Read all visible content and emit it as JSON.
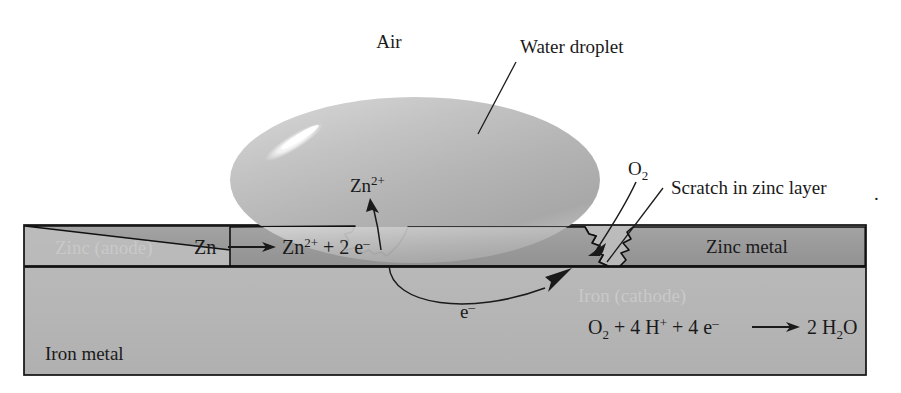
{
  "figure": {
    "colors": {
      "zinc_layer": "#9b9b9b",
      "iron_body": "#b6b6b6",
      "droplet": "#b9b9b9",
      "droplet_highlight": "#ffffff",
      "outline": "#111111",
      "text": "#1a1a1a",
      "ghost_text": "#c9c9c9",
      "background": "#ffffff"
    }
  },
  "labels": {
    "air": "Air",
    "water_droplet": "Water droplet",
    "scratch": "Scratch in zinc layer",
    "zinc_metal": "Zinc metal",
    "iron_metal": "Iron metal",
    "zinc_anode": "Zinc (anode)",
    "iron_cathode": "Iron (cathode)",
    "oxygen": "O",
    "oxygen_sub": "2",
    "electron": "e",
    "electron_sup": "–",
    "zinc_ion": "Zn",
    "zinc_ion_sup": "2+",
    "stray_dot": "."
  },
  "equations": {
    "anode": {
      "full_text": "Zn ⟶ Zn2+ + 2 e–",
      "parts": {
        "reactant": "Zn",
        "arrow": "⟶",
        "product_symbol": "Zn",
        "product_charge": "2+",
        "plus": "+",
        "electrons_count": "2",
        "electrons_symbol": "e",
        "electrons_charge": "–"
      }
    },
    "cathode": {
      "full_text": "O2 + 4 H+ + 4 e– ⟶ 2 H2O",
      "parts": {
        "o2_symbol": "O",
        "o2_sub": "2",
        "plus1": "+",
        "h_count": "4",
        "h_symbol": "H",
        "h_charge": "+",
        "plus2": "+",
        "e_count": "4",
        "e_symbol": "e",
        "e_charge": "–",
        "arrow": "⟶",
        "water_count": "2",
        "water_symbol": "H",
        "water_sub": "2",
        "water_o": "O"
      }
    }
  }
}
